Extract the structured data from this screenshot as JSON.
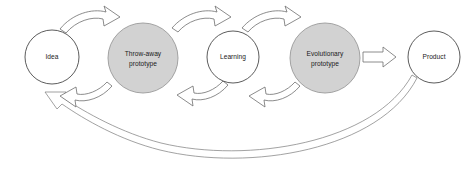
{
  "diagram": {
    "canvas": {
      "width": 475,
      "height": 172,
      "background": "#ffffff"
    },
    "colors": {
      "shaded_fill": "#d2d2d2",
      "open_fill": "#ffffff",
      "stroke": "#6e6e6e",
      "text": "#1a1a1a"
    },
    "nodes": [
      {
        "id": "idea",
        "label": "Idea",
        "lines": [
          "Idea"
        ],
        "style": "open",
        "cx": 52,
        "cy": 57,
        "r": 27
      },
      {
        "id": "throw-away-prototype",
        "label": "Throw-away prototype",
        "lines": [
          "Throw-away",
          "prototype"
        ],
        "style": "shaded",
        "cx": 143,
        "cy": 58,
        "r": 35
      },
      {
        "id": "learning",
        "label": "Learning",
        "lines": [
          "Learning"
        ],
        "style": "open",
        "cx": 233,
        "cy": 57,
        "r": 26
      },
      {
        "id": "evolutionary-prototype",
        "label": "Evolutionary prototype",
        "lines": [
          "Evolutionary",
          "prototype"
        ],
        "style": "shaded",
        "cx": 325,
        "cy": 58,
        "r": 35
      },
      {
        "id": "product",
        "label": "Product",
        "lines": [
          "Product"
        ],
        "style": "open",
        "cx": 434,
        "cy": 57,
        "r": 26
      }
    ],
    "edges": [
      {
        "id": "idea-to-throwaway",
        "from": "Idea",
        "to": "Throw-away prototype",
        "kind": "curved-block-arrow",
        "direction": "forward",
        "position": "top"
      },
      {
        "id": "throwaway-to-learning",
        "from": "Throw-away prototype",
        "to": "Learning",
        "kind": "curved-block-arrow",
        "direction": "forward",
        "position": "top"
      },
      {
        "id": "learning-to-evolutionary",
        "from": "Learning",
        "to": "Evolutionary prototype",
        "kind": "curved-block-arrow",
        "direction": "forward",
        "position": "top"
      },
      {
        "id": "evolutionary-to-product",
        "from": "Evolutionary prototype",
        "to": "Product",
        "kind": "straight-block-arrow",
        "direction": "forward",
        "position": "middle"
      },
      {
        "id": "throwaway-to-idea",
        "from": "Throw-away prototype",
        "to": "Idea",
        "kind": "curved-block-arrow",
        "direction": "backward",
        "position": "bottom"
      },
      {
        "id": "learning-to-throwaway",
        "from": "Learning",
        "to": "Throw-away prototype",
        "kind": "curved-block-arrow",
        "direction": "backward",
        "position": "bottom"
      },
      {
        "id": "evolutionary-to-learning",
        "from": "Evolutionary prototype",
        "to": "Learning",
        "kind": "curved-block-arrow",
        "direction": "backward",
        "position": "bottom"
      },
      {
        "id": "product-to-idea",
        "from": "Product",
        "to": "Idea",
        "kind": "long-thin-return-arrow",
        "direction": "backward",
        "position": "bottom-sweep"
      }
    ]
  }
}
